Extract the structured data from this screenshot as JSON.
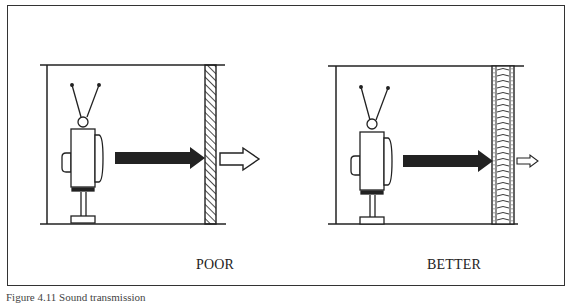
{
  "figure": {
    "panels": [
      {
        "id": "poor",
        "label": "POOR",
        "wall_type": "thin solid wall (hatched)",
        "transmitted_sound": "large"
      },
      {
        "id": "better",
        "label": "BETTER",
        "wall_type": "thick insulated wall",
        "transmitted_sound": "small"
      }
    ],
    "icons": {
      "source": "television-icon",
      "incident_sound": "solid-arrow-icon",
      "transmitted_sound": "outline-arrow-icon"
    },
    "colors": {
      "ink": "#222222",
      "paper": "#ffffff"
    },
    "caption": "Figure 4.11 Sound transmission"
  }
}
